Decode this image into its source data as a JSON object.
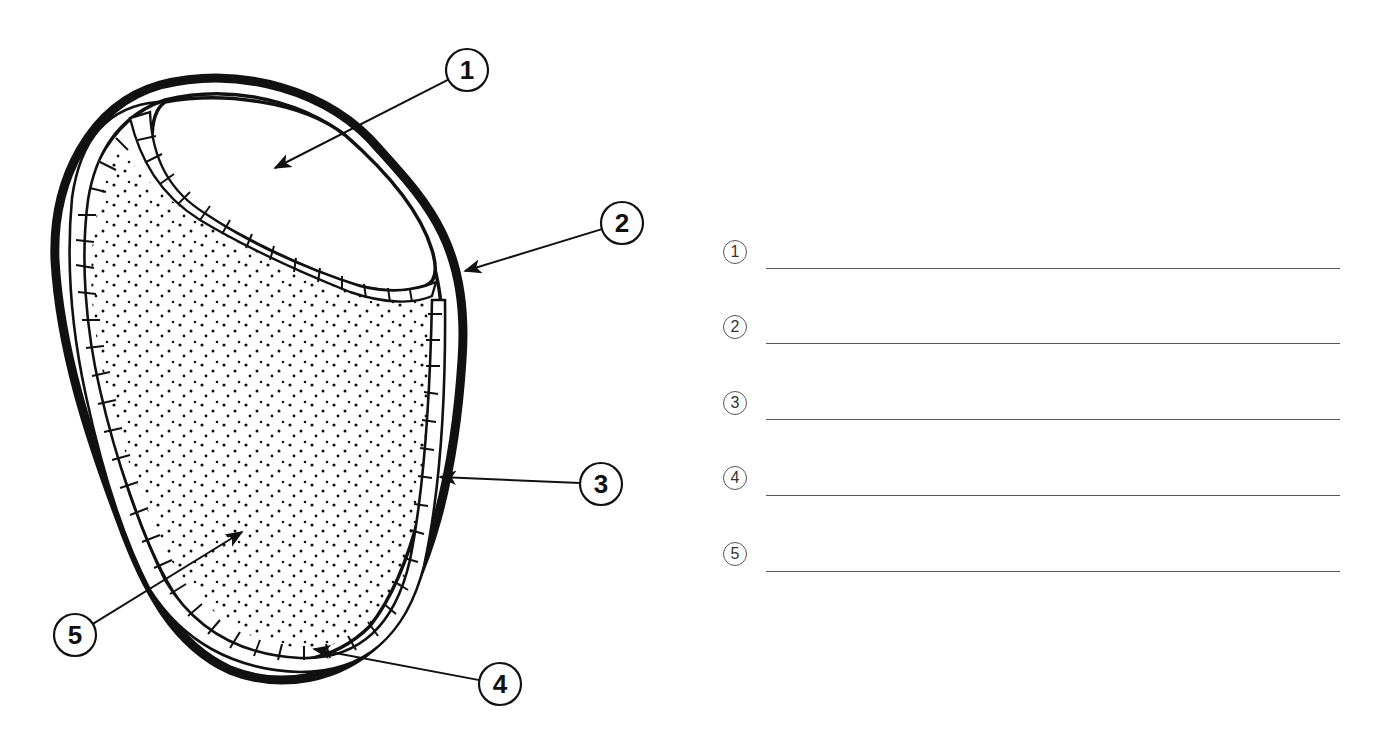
{
  "diagram": {
    "colors": {
      "ink": "#111111",
      "answer_line": "#555555",
      "background": "#ffffff"
    },
    "callouts": [
      {
        "number": "1",
        "cx": 467,
        "cy": 70,
        "target": [
          275,
          168
        ]
      },
      {
        "number": "2",
        "cx": 622,
        "cy": 223,
        "target": [
          465,
          271
        ]
      },
      {
        "number": "3",
        "cx": 601,
        "cy": 484,
        "target": [
          440,
          477
        ]
      },
      {
        "number": "4",
        "cx": 500,
        "cy": 684,
        "target": [
          314,
          649
        ]
      },
      {
        "number": "5",
        "cx": 75,
        "cy": 635,
        "target": [
          242,
          532
        ]
      }
    ]
  },
  "answer_sheet": {
    "rows": [
      {
        "number": "1",
        "value": "",
        "badge_y": 252,
        "line_y": 268
      },
      {
        "number": "2",
        "value": "",
        "badge_y": 327,
        "line_y": 343
      },
      {
        "number": "3",
        "value": "",
        "badge_y": 403,
        "line_y": 419
      },
      {
        "number": "4",
        "value": "",
        "badge_y": 478,
        "line_y": 495
      },
      {
        "number": "5",
        "value": "",
        "badge_y": 554,
        "line_y": 571
      }
    ],
    "badge_x": 735,
    "line_x_start": 766,
    "line_x_end": 1340
  }
}
